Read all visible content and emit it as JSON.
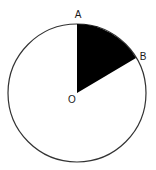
{
  "diagram": {
    "type": "circle-sector",
    "circle": {
      "cx": 77,
      "cy": 93,
      "r": 69,
      "stroke": "#333333",
      "fill": "#ffffff"
    },
    "sector": {
      "fill": "#000000",
      "from_point": "A",
      "to_point": "B"
    },
    "points": {
      "O": {
        "label": "O",
        "x": 77,
        "y": 93,
        "label_x": 72,
        "label_y": 103
      },
      "A": {
        "label": "A",
        "x": 77,
        "y": 24,
        "label_x": 78,
        "label_y": 18
      },
      "B": {
        "label": "B",
        "x": 136,
        "y": 58,
        "label_x": 143,
        "label_y": 60
      }
    }
  }
}
